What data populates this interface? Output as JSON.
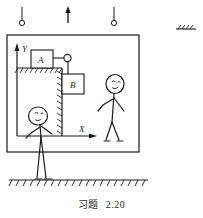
{
  "figure": {
    "caption_label": "习题",
    "caption_number": "2.20",
    "axes": {
      "y_label": "Y",
      "x_label": "X"
    },
    "bodies": [
      {
        "id": "A",
        "label": "A",
        "description": "block-a-on-horizontal-surface"
      },
      {
        "id": "B",
        "label": "B",
        "description": "block-b-hanging-against-vertical-surface"
      }
    ],
    "elements": {
      "outer_frame": "enclosure-box",
      "pulley": "corner-pulley",
      "cord": "connecting-cord",
      "support_block": "l-shaped-hatched-support",
      "ground": "hatched-ground-line",
      "hangers": "two-ring-hangers",
      "up_arrow": "upward-acceleration-arrow",
      "corner_mark": "top-right-hatch-mark",
      "person_left": "stick-figure-outside-standing-on-ground",
      "person_right": "stick-figure-inside-box"
    },
    "colors": {
      "ink": "#1a1a1a",
      "paper": "#ffffff",
      "caption": "#2b2b2b"
    }
  }
}
